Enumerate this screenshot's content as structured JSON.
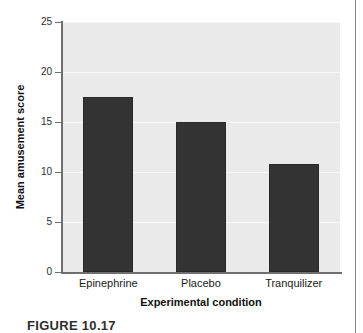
{
  "caption": {
    "text": "FIGURE 10.17"
  },
  "colors": {
    "bar_fill": "#333333",
    "plot_background": "#eaeaea",
    "gridline": "#f7f7f7",
    "axis": "#6f6f6f",
    "page_rule": "#8a8a8a"
  },
  "chart_data": {
    "type": "bar",
    "title": "",
    "categories": [
      "Epinephrine",
      "Placebo",
      "Tranquilizer"
    ],
    "values": [
      17.5,
      15.0,
      10.8
    ],
    "xlabel": "Experimental condition",
    "ylabel": "Mean amusement score",
    "ylim": [
      0,
      25
    ],
    "yticks": [
      0,
      5,
      10,
      15,
      20,
      25
    ],
    "ytick_labels": [
      "0",
      "5",
      "10",
      "15",
      "20",
      "25"
    ],
    "grid": true,
    "grid_axis": "y",
    "legend": null,
    "legend_position": "none",
    "series": [
      {
        "name": "Mean amusement score",
        "values": [
          17.5,
          15.0,
          10.8
        ]
      }
    ]
  }
}
